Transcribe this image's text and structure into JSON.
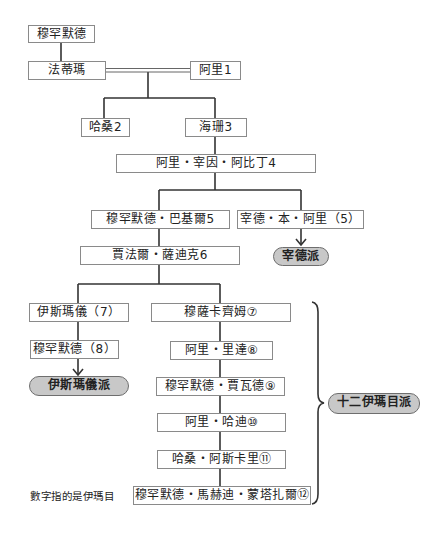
{
  "diagram": {
    "title": "",
    "colors": {
      "line": "#333333",
      "box_border": "#8a8a8a",
      "box_fill": "#ffffff",
      "pill_fill": "#c8c8c8",
      "pill_border": "#6e6e6e",
      "text": "#222222"
    },
    "nodes": {
      "muhammad": "穆罕默德",
      "fatima": "法蒂瑪",
      "ali1": "阿里1",
      "hasan2": "哈桑2",
      "husayn3": "海珊3",
      "ali_zayn4": "阿里・宰因・阿比丁4",
      "muhammad_baqir5": "穆罕默德・巴基爾5",
      "zayd_bin_ali5": "宰德・本・阿里（5）",
      "jafar_sadiq6": "賈法爾・薩迪克6",
      "ismail7": "伊斯瑪儀（7）",
      "muhammad8": "穆罕默德（8）",
      "musa_kazim7": "穆薩卡齊姆⑦",
      "ali_rida8": "阿里・里達⑧",
      "muhammad_jawad9": "穆罕默德・賈瓦德⑨",
      "ali_hadi10": "阿里・哈迪⑩",
      "hasan_askari11": "哈桑・阿斯卡里⑪",
      "muhammad_mahdi12": "穆罕默德・馬赫迪・蒙塔扎爾⑫"
    },
    "sects": {
      "zaydi": "宰德派",
      "ismaili": "伊斯瑪儀派",
      "twelver": "十二伊瑪目派"
    },
    "note": "數字指的是伊瑪目"
  }
}
